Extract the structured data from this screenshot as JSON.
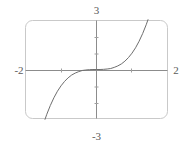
{
  "widget": {
    "name": "graphing-calculator-plot",
    "frame_color": "#c9c9c9",
    "axis_color": "#8c8c8c",
    "curve_color": "#6e6e6e",
    "label_color": "#5a5a5a",
    "background": "#ffffff"
  },
  "labels": {
    "top": "3",
    "bottom": "-3",
    "left": "-2",
    "right": "2"
  },
  "chart_data": {
    "type": "line",
    "title": "",
    "subtitle": "",
    "xlabel": "",
    "ylabel": "",
    "xlim": [
      -2,
      2
    ],
    "ylim": [
      -3,
      3
    ],
    "grid": false,
    "legend": false,
    "legend_position": "none",
    "x_tick_labels": [
      "-2",
      "2"
    ],
    "y_tick_labels": [
      "3",
      "-3"
    ],
    "x_ticks": [
      -1,
      1
    ],
    "y_ticks": [
      -2,
      -1,
      1,
      2
    ],
    "annotations": [],
    "series": [
      {
        "name": "y = x^3",
        "x": [
          -1.45,
          -1.4,
          -1.3,
          -1.2,
          -1.1,
          -1.0,
          -0.9,
          -0.8,
          -0.7,
          -0.6,
          -0.5,
          -0.4,
          -0.3,
          -0.2,
          -0.1,
          0.0,
          0.1,
          0.2,
          0.3,
          0.4,
          0.5,
          0.6,
          0.7,
          0.8,
          0.9,
          1.0,
          1.1,
          1.2,
          1.3,
          1.4,
          1.45
        ],
        "y": [
          -3.05,
          -2.74,
          -2.2,
          -1.73,
          -1.33,
          -1.0,
          -0.73,
          -0.51,
          -0.34,
          -0.22,
          -0.13,
          -0.06,
          -0.03,
          -0.01,
          0.0,
          0.0,
          0.0,
          0.01,
          0.03,
          0.06,
          0.13,
          0.22,
          0.34,
          0.51,
          0.73,
          1.0,
          1.33,
          1.73,
          2.2,
          2.74,
          3.05
        ]
      }
    ]
  }
}
